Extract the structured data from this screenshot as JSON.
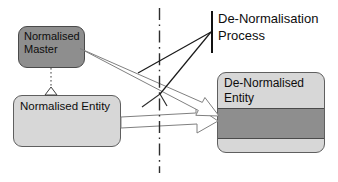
{
  "diagram": {
    "nodes": {
      "master": {
        "label": "Normalised\nMaster"
      },
      "entity": {
        "label": "Normalised Entity"
      },
      "denormalised": {
        "label": "De-Normalised\nEntity"
      }
    },
    "annotation": {
      "process_label": "De-Normalisation\nProcess"
    },
    "colors": {
      "node_dark_fill": "#8e8e8e",
      "node_light_fill": "#d7d7d7",
      "node_outline": "#4a4a4a",
      "arrow_fill": "#ffffff",
      "arrow_outline": "#808080",
      "callout_line": "#1a1a1a",
      "background": "#ffffff"
    }
  }
}
